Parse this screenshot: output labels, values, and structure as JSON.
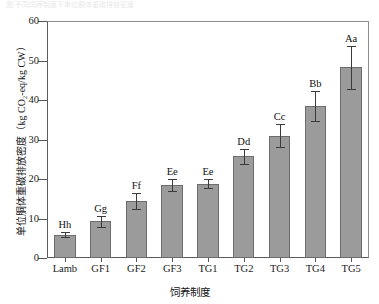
{
  "figure": {
    "caption_fragment": "图 不同饲养制度下单位胴体重碳排放密度",
    "x_axis_title": "饲养制度",
    "y_axis_title_cn": "单位胴体重碳排放密度",
    "y_axis_title_unit": "（kg CO₂-eq/kg CW）"
  },
  "chart_data": {
    "type": "bar",
    "title": "",
    "xlabel": "饲养制度",
    "ylabel": "单位胴体重碳排放密度（kg CO₂-eq/kg CW）",
    "ylim": [
      0,
      60
    ],
    "yticks": [
      0,
      10,
      20,
      30,
      40,
      50,
      60
    ],
    "ytick_labels": [
      "0",
      "10",
      "20",
      "30",
      "40",
      "50",
      "60"
    ],
    "grid": false,
    "legend": null,
    "categories": [
      "Lamb",
      "GF1",
      "GF2",
      "GF3",
      "TG1",
      "TG2",
      "TG3",
      "TG4",
      "TG5"
    ],
    "values": [
      5.9,
      9.3,
      14.4,
      18.5,
      18.8,
      25.7,
      31.0,
      38.5,
      48.3
    ],
    "errors": [
      0.7,
      1.4,
      2.0,
      1.5,
      1.2,
      2.0,
      2.9,
      3.8,
      5.4
    ],
    "annotations": [
      "Hh",
      "Gg",
      "Ff",
      "Ee",
      "Ee",
      "Dd",
      "Cc",
      "Bb",
      "Aa"
    ],
    "bar_color": "#9b9b9b",
    "bar_edge_color": "#6d6d6d",
    "error_color": "#3b3b3b"
  }
}
